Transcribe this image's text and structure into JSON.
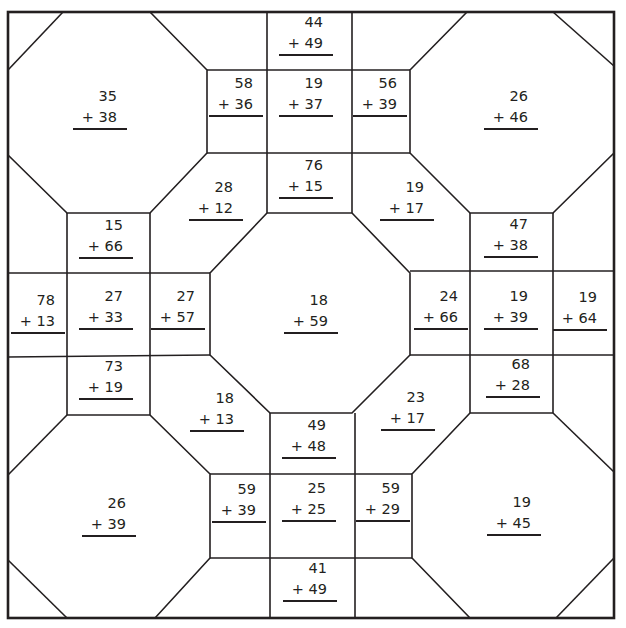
{
  "worksheet": {
    "type": "two-digit addition with regrouping quilt pattern",
    "line_color": "#231f20",
    "problems": [
      {
        "id": "p1",
        "top": "35",
        "bottom": "+ 38",
        "x": 73,
        "y": 86
      },
      {
        "id": "p2",
        "top": "58",
        "bottom": "+ 36",
        "x": 209,
        "y": 73
      },
      {
        "id": "p3",
        "top": "19",
        "bottom": "+ 37",
        "x": 279,
        "y": 73
      },
      {
        "id": "p4",
        "top": "56",
        "bottom": "+ 39",
        "x": 353,
        "y": 73
      },
      {
        "id": "p5",
        "top": "44",
        "bottom": "+ 49",
        "x": 279,
        "y": 12
      },
      {
        "id": "p6",
        "top": "26",
        "bottom": "+ 46",
        "x": 484,
        "y": 86
      },
      {
        "id": "p7",
        "top": "28",
        "bottom": "+ 12",
        "x": 189,
        "y": 177
      },
      {
        "id": "p8",
        "top": "76",
        "bottom": "+ 15",
        "x": 279,
        "y": 155
      },
      {
        "id": "p9",
        "top": "19",
        "bottom": "+ 17",
        "x": 380,
        "y": 177
      },
      {
        "id": "p10",
        "top": "15",
        "bottom": "+ 66",
        "x": 79,
        "y": 215
      },
      {
        "id": "p11",
        "top": "47",
        "bottom": "+ 38",
        "x": 484,
        "y": 214
      },
      {
        "id": "p12",
        "top": "78",
        "bottom": "+ 13",
        "x": 11,
        "y": 290
      },
      {
        "id": "p13",
        "top": "27",
        "bottom": "+ 33",
        "x": 79,
        "y": 286
      },
      {
        "id": "p14",
        "top": "27",
        "bottom": "+ 57",
        "x": 151,
        "y": 286
      },
      {
        "id": "p15",
        "top": "18",
        "bottom": "+ 59",
        "x": 284,
        "y": 290
      },
      {
        "id": "p16",
        "top": "24",
        "bottom": "+ 66",
        "x": 414,
        "y": 286
      },
      {
        "id": "p17",
        "top": "19",
        "bottom": "+ 39",
        "x": 484,
        "y": 286
      },
      {
        "id": "p18",
        "top": "19",
        "bottom": "+ 64",
        "x": 553,
        "y": 287
      },
      {
        "id": "p19",
        "top": "73",
        "bottom": "+ 19",
        "x": 79,
        "y": 356
      },
      {
        "id": "p20",
        "top": "68",
        "bottom": "+ 28",
        "x": 486,
        "y": 354
      },
      {
        "id": "p21",
        "top": "18",
        "bottom": "+ 13",
        "x": 190,
        "y": 388
      },
      {
        "id": "p22",
        "top": "23",
        "bottom": "+ 17",
        "x": 381,
        "y": 387
      },
      {
        "id": "p23",
        "top": "49",
        "bottom": "+ 48",
        "x": 282,
        "y": 415
      },
      {
        "id": "p24",
        "top": "26",
        "bottom": "+ 39",
        "x": 82,
        "y": 493
      },
      {
        "id": "p25",
        "top": "59",
        "bottom": "+ 39",
        "x": 212,
        "y": 479
      },
      {
        "id": "p26",
        "top": "25",
        "bottom": "+ 25",
        "x": 282,
        "y": 478
      },
      {
        "id": "p27",
        "top": "59",
        "bottom": "+ 29",
        "x": 356,
        "y": 478
      },
      {
        "id": "p28",
        "top": "19",
        "bottom": "+ 45",
        "x": 487,
        "y": 492
      },
      {
        "id": "p29",
        "top": "41",
        "bottom": "+ 49",
        "x": 283,
        "y": 558
      }
    ]
  }
}
